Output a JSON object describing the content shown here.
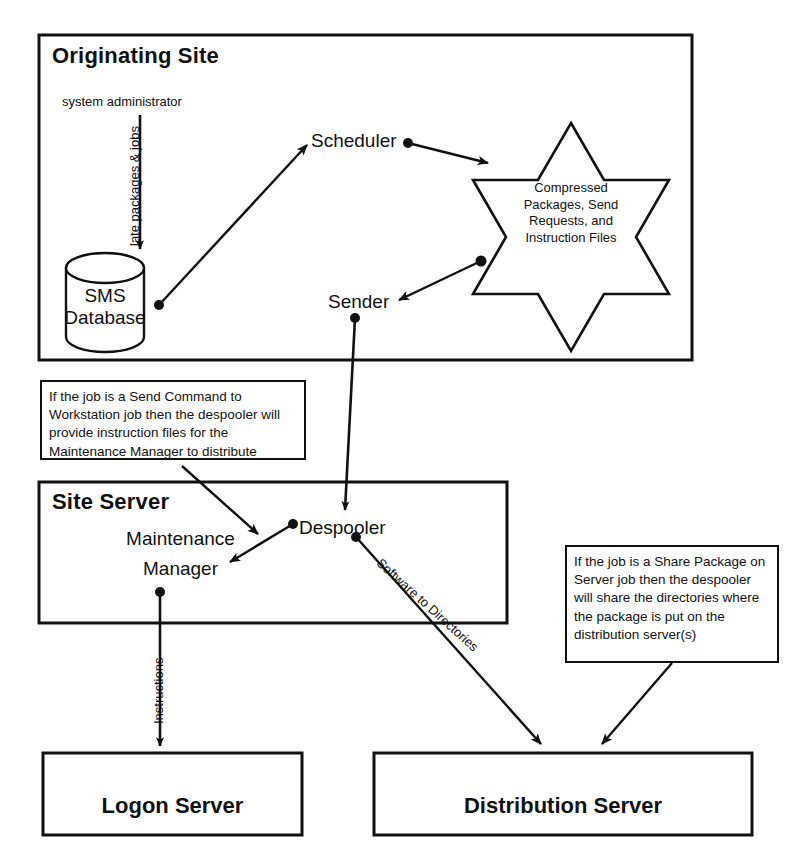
{
  "diagram": {
    "title_visible": false,
    "groups": [
      {
        "id": "originating-site",
        "label": "Originating Site"
      },
      {
        "id": "site-server",
        "label": "Site Server"
      },
      {
        "id": "logon-server",
        "label": "Logon Server"
      },
      {
        "id": "distribution-server",
        "label": "Distribution Server"
      }
    ],
    "nodes": [
      {
        "id": "system-administrator",
        "label": "system administrator"
      },
      {
        "id": "sms-database",
        "label_line1": "SMS",
        "label_line2": "Database"
      },
      {
        "id": "scheduler",
        "label": "Scheduler"
      },
      {
        "id": "sender",
        "label": "Sender"
      },
      {
        "id": "despooler",
        "label": "Despooler"
      },
      {
        "id": "maintenance-manager",
        "label_line1": "Maintenance",
        "label_line2": "Manager"
      },
      {
        "id": "star-store",
        "label": "Compressed Packages, Send Requests, and Instruction Files",
        "lines": [
          "Compressed",
          "Packages, Send",
          "Requests, and",
          "Instruction Files"
        ]
      }
    ],
    "edge_labels": [
      {
        "id": "create-packages-jobs",
        "text": "late packages & jobs"
      },
      {
        "id": "software-to-directories",
        "text": "Software to Directories"
      },
      {
        "id": "instructions",
        "text": "Instructions"
      }
    ],
    "notes": [
      {
        "id": "note-send-command",
        "text": "If the job is a Send Command to Workstation job then the despooler will provide instruction files for the Maintenance Manager to distribute"
      },
      {
        "id": "note-share-package",
        "text": "If the job is a Share Package on Server job then the despooler will share the directories where the package is put on the distribution server(s)"
      }
    ],
    "colors": {
      "stroke": "#111111",
      "background": "#ffffff",
      "text": "#111111"
    }
  }
}
